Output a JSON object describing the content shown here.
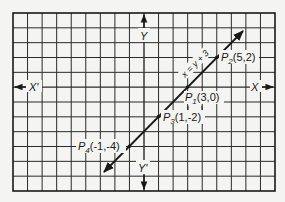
{
  "chart_data": {
    "type": "line",
    "title": "",
    "xlabel": "X",
    "ylabel": "Y",
    "xlabel_neg": "X'",
    "ylabel_neg": "Y'",
    "grid": true,
    "xlim": [
      -9,
      9
    ],
    "ylim": [
      -7,
      5
    ],
    "line": {
      "equation": "x = y + 3",
      "x": [
        -2.75,
        6.8
      ],
      "y": [
        -5.75,
        3.8
      ]
    },
    "points": [
      {
        "name": "P1",
        "sub": "1",
        "label": "(3,0)",
        "x": 3,
        "y": 0
      },
      {
        "name": "P2",
        "sub": "2",
        "label": "(5,2)",
        "x": 5,
        "y": 2
      },
      {
        "name": "P3",
        "sub": "3",
        "label": "(1,-2)",
        "x": 1,
        "y": -2
      },
      {
        "name": "P4",
        "sub": "4",
        "label": "(-1,-4)",
        "x": -1,
        "y": -4
      }
    ]
  },
  "labels": {
    "x": "X",
    "x_neg": "X'",
    "y": "Y",
    "y_neg": "Y'",
    "equation": "x = y + 3",
    "p1_letter": "P",
    "p1_sub": "1",
    "p1_coord": "(3,0)",
    "p2_letter": "P",
    "p2_sub": "2",
    "p2_coord": "(5,2)",
    "p3_letter": "P",
    "p3_sub": "3",
    "p3_coord": "(1,-2)",
    "p4_letter": "P",
    "p4_sub": "4",
    "p4_coord": "(-1,-4)"
  },
  "colors": {
    "ink": "#1a1a1a",
    "paper": "#f4f4f2"
  }
}
